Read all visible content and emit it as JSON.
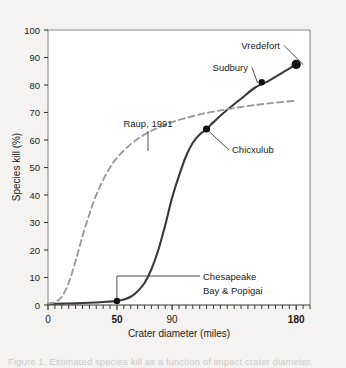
{
  "figure": {
    "background_color": "#f4f3f1",
    "plot_background_color": "#ffffff",
    "frame_color": "#8a8a8a",
    "caption": "Figure 1. Estimated species kill as a function of impact crater diameter."
  },
  "chart_data": {
    "type": "line",
    "title": "",
    "xlabel": "Crater diameter (miles)",
    "ylabel": "Species kill (%)",
    "xlim": [
      0,
      190
    ],
    "ylim": [
      0,
      100
    ],
    "grid": false,
    "legend_position": "none",
    "x_ticks_labeled": [
      0,
      50,
      90,
      180
    ],
    "x_tick_labels": [
      "0",
      "50",
      "90",
      "180"
    ],
    "x_minor_tick_step": 5,
    "y_ticks": [
      0,
      10,
      20,
      30,
      40,
      50,
      60,
      70,
      80,
      90,
      100
    ],
    "y_tick_labels": [
      "0",
      "10",
      "20",
      "30",
      "40",
      "50",
      "60",
      "70",
      "80",
      "90",
      "100"
    ],
    "series": [
      {
        "name": "Impact kill curve",
        "style": "solid",
        "color": "#3a3a3a",
        "x": [
          0,
          10,
          20,
          30,
          40,
          50,
          55,
          60,
          65,
          70,
          75,
          80,
          85,
          90,
          95,
          100,
          105,
          110,
          115,
          120,
          130,
          140,
          150,
          160,
          170,
          180
        ],
        "y": [
          0.4,
          0.5,
          0.6,
          0.8,
          1.1,
          1.5,
          2.0,
          3.0,
          5.0,
          8.0,
          13.0,
          20.0,
          29.0,
          39.0,
          47.0,
          54.0,
          59.0,
          62.0,
          64.0,
          66.5,
          71.0,
          75.0,
          79.0,
          81.5,
          84.5,
          87.5
        ]
      },
      {
        "name": "Raup, 1991",
        "style": "dashed",
        "color": "#9a9a9a",
        "x": [
          0,
          5,
          10,
          15,
          20,
          25,
          30,
          35,
          40,
          45,
          50,
          60,
          70,
          80,
          90,
          100,
          110,
          120,
          140,
          160,
          180
        ],
        "y": [
          0.5,
          1.0,
          3.0,
          8.0,
          16.0,
          25.0,
          33.0,
          40.0,
          45.5,
          50.0,
          53.5,
          58.5,
          62.0,
          64.5,
          66.5,
          68.0,
          69.3,
          70.3,
          72.0,
          73.3,
          74.3
        ]
      }
    ],
    "points": [
      {
        "label": "Chesapeake Bay & Popigai",
        "x": 50,
        "y": 1.5,
        "marker_size": 3.2
      },
      {
        "label": "Chicxulub",
        "x": 115,
        "y": 64,
        "marker_size": 3.6
      },
      {
        "label": "Sudbury",
        "x": 155,
        "y": 81,
        "marker_size": 3.2
      },
      {
        "label": "Vredefort",
        "x": 180,
        "y": 87.5,
        "marker_size": 4.6
      }
    ],
    "annotations": [
      {
        "name": "vredefort",
        "text": "Vredefort",
        "anchor_x": 280,
        "anchor_y": 49
      },
      {
        "name": "sudbury",
        "text": "Sudbury",
        "anchor_x": 248,
        "anchor_y": 71
      },
      {
        "name": "chicxulub",
        "text": "Chicxulub",
        "anchor_x": 232,
        "anchor_y": 153
      },
      {
        "name": "raup",
        "text": "Raup, 1991",
        "anchor_x": 148,
        "anchor_y": 127
      },
      {
        "name": "chesapeake-line1",
        "text": "Chesapeake",
        "anchor_x": 203,
        "anchor_y": 280
      },
      {
        "name": "chesapeake-line2",
        "text": "Bay & Popigai",
        "anchor_x": 203,
        "anchor_y": 294
      }
    ]
  }
}
